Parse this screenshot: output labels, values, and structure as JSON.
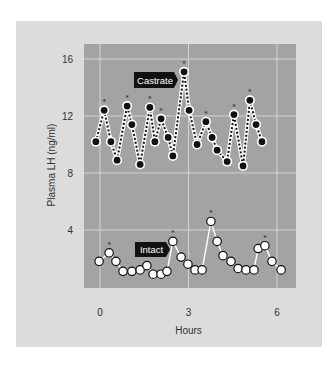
{
  "chart_data": {
    "type": "line",
    "title": "",
    "xlabel": "Hours",
    "ylabel": "Plasma LH (ng/ml)",
    "xlim": [
      -0.15,
      6.6
    ],
    "ylim": [
      0,
      16.8
    ],
    "x_ticks": [
      0,
      3,
      6
    ],
    "x_tick_labels": [
      "0",
      "3",
      "6"
    ],
    "y_ticks": [
      4,
      8,
      12,
      16
    ],
    "y_tick_labels": [
      "4",
      "8",
      "12",
      "16"
    ],
    "grid": true,
    "legend": "inline labels",
    "series": [
      {
        "name": "Castrate",
        "marker": "filled-circle",
        "line": "dotted-white",
        "x": [
          -0.14,
          0.14,
          0.37,
          0.58,
          0.92,
          1.08,
          1.36,
          1.69,
          1.86,
          2.07,
          2.31,
          2.47,
          2.85,
          3.02,
          3.29,
          3.59,
          3.8,
          3.97,
          4.31,
          4.54,
          4.85,
          5.08,
          5.29,
          5.49
        ],
        "values": [
          10.2,
          12.4,
          10.2,
          8.9,
          12.7,
          11.4,
          8.6,
          12.6,
          10.2,
          11.8,
          10.5,
          9.2,
          15.1,
          12.4,
          10.0,
          11.6,
          10.5,
          9.6,
          8.8,
          12.1,
          8.5,
          13.1,
          11.4,
          10.2
        ],
        "significant_peaks": [
          1,
          4,
          7,
          9,
          12,
          15,
          19,
          21
        ]
      },
      {
        "name": "Intact",
        "marker": "open-circle",
        "line": "solid-white",
        "x": [
          -0.03,
          0.31,
          0.54,
          0.78,
          1.08,
          1.36,
          1.59,
          1.8,
          2.07,
          2.27,
          2.47,
          2.75,
          2.98,
          3.22,
          3.46,
          3.76,
          3.97,
          4.17,
          4.44,
          4.68,
          4.95,
          5.22,
          5.36,
          5.59,
          5.83,
          6.14
        ],
        "values": [
          1.8,
          2.4,
          1.8,
          1.1,
          1.1,
          1.2,
          1.5,
          0.9,
          0.9,
          1.1,
          3.2,
          2.1,
          1.6,
          1.2,
          1.2,
          4.6,
          3.2,
          2.2,
          1.8,
          1.3,
          1.2,
          1.2,
          2.7,
          2.9,
          1.8,
          1.2
        ],
        "significant_peaks": [
          1,
          10,
          15,
          23
        ]
      }
    ],
    "annotations": [
      "*"
    ]
  },
  "labels": {
    "castrate": "Castrate",
    "intact": "Intact",
    "peak_marker": "*"
  },
  "colors": {
    "frame_bg": "#dcdcdc",
    "plot_bg": "#a3a3a3",
    "grid": "#d2d2d2",
    "marker_fill_dark": "#111111",
    "marker_fill_light": "#ffffff",
    "label_bg": "#111111",
    "text": "#333333"
  }
}
